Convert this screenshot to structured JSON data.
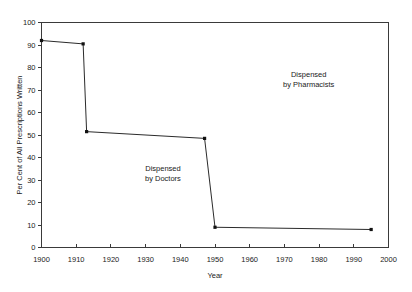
{
  "chart_data": {
    "type": "line",
    "title": "",
    "xlabel": "Year",
    "ylabel": "Per Cent of All Prescriptions Written",
    "xlim": [
      1900,
      2000
    ],
    "ylim": [
      0,
      100
    ],
    "xticks": [
      1900,
      1910,
      1920,
      1930,
      1940,
      1950,
      1960,
      1970,
      1980,
      1990,
      2000
    ],
    "yticks": [
      0,
      10,
      20,
      30,
      40,
      50,
      60,
      70,
      80,
      90,
      100
    ],
    "grid": false,
    "legend": "none",
    "series": [
      {
        "name": "Per cent of prescriptions dispensed by doctors",
        "x": [
          1900,
          1912,
          1913,
          1947,
          1950,
          1995
        ],
        "values": [
          92,
          90.5,
          51.5,
          48.5,
          9,
          8
        ]
      }
    ],
    "annotations": [
      {
        "name": "dispensed-by-doctors",
        "line1": "Dispensed",
        "line2": "by Doctors",
        "x": 1935,
        "y": 34
      },
      {
        "name": "dispensed-by-pharmacists",
        "line1": "Dispensed",
        "line2": "by Pharmacists",
        "x": 1977,
        "y": 76
      }
    ]
  }
}
